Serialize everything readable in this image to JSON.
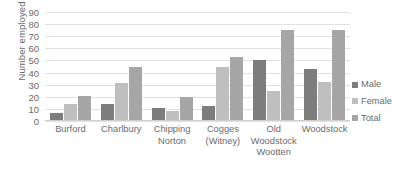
{
  "chart_data": {
    "type": "bar",
    "title": "",
    "xlabel": "",
    "ylabel": "Number employed",
    "ylim": [
      0,
      90
    ],
    "yticks": [
      0,
      10,
      20,
      30,
      40,
      50,
      60,
      70,
      80,
      90
    ],
    "grid": true,
    "legend_position": "right",
    "categories": [
      "Burford",
      "Charlbury",
      "Chipping Norton",
      "Cogges (Witney)",
      "Old Woodstock Wootten",
      "Woodstock"
    ],
    "category_lines": [
      [
        "Burford"
      ],
      [
        "Charlbury"
      ],
      [
        "Chipping",
        "Norton"
      ],
      [
        "Cogges",
        "(Witney)"
      ],
      [
        "Old",
        "Woodstock",
        "Wootten"
      ],
      [
        "Woodstock"
      ]
    ],
    "series": [
      {
        "name": "Male",
        "color": "#7d7d7d",
        "values": [
          7,
          14,
          11,
          12,
          50,
          43
        ]
      },
      {
        "name": "Female",
        "color": "#bfbfbf",
        "values": [
          14,
          31,
          8,
          45,
          25,
          32
        ]
      },
      {
        "name": "Total",
        "color": "#a6a6a6",
        "values": [
          21,
          45,
          20,
          53,
          75,
          75
        ]
      }
    ]
  },
  "legend": {
    "items": [
      {
        "label": "Male"
      },
      {
        "label": "Female"
      },
      {
        "label": "Total"
      }
    ]
  },
  "axis": {
    "y_title": "Number employed"
  }
}
